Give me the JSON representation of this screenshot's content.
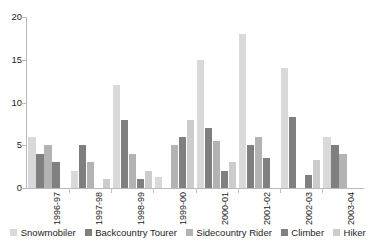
{
  "chart_data": {
    "type": "bar",
    "title": "",
    "subtitle": "",
    "xlabel": "",
    "ylabel": "",
    "ylim": [
      0,
      20
    ],
    "yticks": [
      0,
      5,
      10,
      15,
      20
    ],
    "grid": false,
    "legend_position": "bottom",
    "categories": [
      "1996-97",
      "1997-98",
      "1998-99",
      "1999-00",
      "2000-01",
      "2001-02",
      "2002-03",
      "2003-04"
    ],
    "series": [
      {
        "name": "Snowmobiler",
        "color": "#d9d9d9",
        "values": [
          6,
          2,
          12,
          1.3,
          15,
          18,
          14,
          6
        ]
      },
      {
        "name": "Backcountry Tourer",
        "color": "#7f7f7f",
        "values": [
          4,
          5,
          8,
          0,
          7,
          5,
          8.3,
          5
        ]
      },
      {
        "name": "Sidecountry Rider",
        "color": "#b3b3b3",
        "values": [
          5,
          3,
          4,
          5,
          5.5,
          6,
          0,
          4
        ]
      },
      {
        "name": "Climber",
        "color": "#808080",
        "values": [
          3,
          0,
          1,
          6,
          2,
          3.5,
          1.5,
          0
        ]
      },
      {
        "name": "Hiker",
        "color": "#cccccc",
        "values": [
          0,
          1,
          2,
          8,
          3,
          0,
          3.3,
          0
        ]
      }
    ]
  },
  "legend": {
    "items": [
      {
        "label": "Snowmobiler",
        "color": "#d9d9d9"
      },
      {
        "label": "Backcountry Tourer",
        "color": "#7f7f7f"
      },
      {
        "label": "Sidecountry Rider",
        "color": "#b3b3b3"
      },
      {
        "label": "Climber",
        "color": "#808080"
      },
      {
        "label": "Hiker",
        "color": "#cccccc"
      }
    ]
  }
}
